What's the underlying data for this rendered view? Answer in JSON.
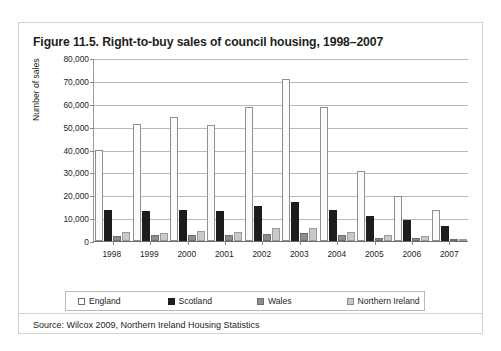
{
  "top_bleed_text": "",
  "figure": {
    "title": "Figure 11.5. Right-to-buy sales of council housing, 1998–2007",
    "source": "Source: Wilcox 2009, Northern Ireland Housing Statistics"
  },
  "legend": {
    "items": [
      {
        "label": "England",
        "key": "england",
        "color": "#ffffff"
      },
      {
        "label": "Scotland",
        "key": "scotland",
        "color": "#1d1d1d"
      },
      {
        "label": "Wales",
        "key": "wales",
        "color": "#8d8d8d"
      },
      {
        "label": "Northern Ireland",
        "key": "ni",
        "color": "#c9c9c9"
      }
    ]
  },
  "chart_data": {
    "type": "bar",
    "title": "Figure 11.5. Right-to-buy sales of council housing, 1998–2007",
    "xlabel": "",
    "ylabel": "Number of sales",
    "ylim": [
      0,
      80000
    ],
    "ytick_step": 10000,
    "ytick_labels": [
      "80,000",
      "70,000",
      "60,000",
      "50,000",
      "40,000",
      "30,000",
      "20,000",
      "10,000",
      "0"
    ],
    "ytick_values": [
      80000,
      70000,
      60000,
      50000,
      40000,
      30000,
      20000,
      10000,
      0
    ],
    "grid": true,
    "legend_position": "bottom",
    "categories": [
      "1998",
      "1999",
      "2000",
      "2001",
      "2002",
      "2003",
      "2004",
      "2005",
      "2006",
      "2007"
    ],
    "series": [
      {
        "name": "England",
        "values": [
          40000,
          51000,
          54000,
          50500,
          58500,
          71000,
          58500,
          30500,
          19500,
          13500
        ]
      },
      {
        "name": "Scotland",
        "values": [
          13500,
          13000,
          13500,
          13000,
          15500,
          17000,
          13500,
          11000,
          9000,
          6500
        ]
      },
      {
        "name": "Wales",
        "values": [
          2000,
          2500,
          2500,
          2500,
          3000,
          3500,
          2500,
          1500,
          1500,
          1000
        ]
      },
      {
        "name": "Northern Ireland",
        "values": [
          4000,
          3500,
          4500,
          4000,
          5500,
          5500,
          4000,
          2500,
          2000,
          1000
        ]
      }
    ]
  }
}
